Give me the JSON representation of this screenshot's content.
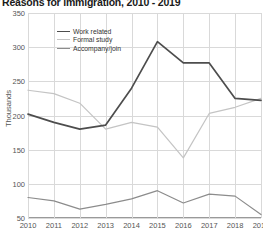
{
  "chart_data": {
    "type": "line",
    "title": "Reasons for immigration, 2010 - 2019",
    "xlabel": "",
    "ylabel": "Thousands",
    "categories": [
      "2010",
      "2011",
      "2012",
      "2013",
      "2014",
      "2015",
      "2016",
      "2017",
      "2018",
      "2019"
    ],
    "ylim": [
      50,
      350
    ],
    "yticks": [
      50,
      100,
      150,
      200,
      250,
      300,
      350
    ],
    "grid": true,
    "legend_position": "top-left-inside",
    "series": [
      {
        "name": "Work related",
        "color": "#4d4d4d",
        "values": [
          202,
          190,
          180,
          186,
          240,
          308,
          277,
          277,
          225,
          222
        ]
      },
      {
        "name": "Formal study",
        "color": "#c4c4c4",
        "values": [
          237,
          232,
          218,
          180,
          190,
          183,
          138,
          203,
          212,
          225
        ]
      },
      {
        "name": "Accompany/join",
        "color": "#8c8c8c",
        "values": [
          80,
          75,
          63,
          70,
          78,
          90,
          72,
          85,
          82,
          55
        ]
      }
    ]
  },
  "legend": {
    "items": [
      {
        "label": "Work related"
      },
      {
        "label": "Formal study"
      },
      {
        "label": "Accompany/join"
      }
    ]
  }
}
